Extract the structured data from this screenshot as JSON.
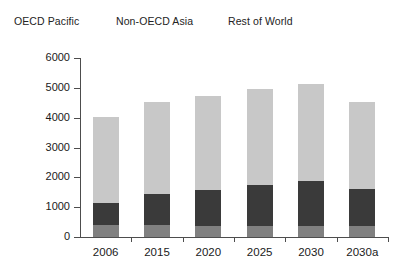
{
  "chart_data": {
    "type": "bar",
    "subtype": "stacked-vertical",
    "title": "",
    "xlabel": "",
    "ylabel": "Mtoe",
    "ylim": [
      0,
      6000
    ],
    "ytick_values": [
      0,
      1000,
      2000,
      3000,
      4000,
      5000,
      6000
    ],
    "ytick_labels": [
      "0",
      "1000",
      "2000",
      "3000",
      "4000",
      "5000",
      "6000"
    ],
    "grid": false,
    "legend_position": "top",
    "categories": [
      "2006",
      "2015",
      "2020",
      "2025",
      "2030",
      "2030a"
    ],
    "series": [
      {
        "name": "OECD Pacific",
        "color": "#808080",
        "values": [
          400,
          390,
          370,
          380,
          370,
          360
        ]
      },
      {
        "name": "Non-OECD Asia",
        "color": "#3a3a3a",
        "values": [
          750,
          1060,
          1210,
          1360,
          1520,
          1260
        ]
      },
      {
        "name": "Rest of World",
        "color": "#c8c8c8",
        "values": [
          2870,
          3060,
          3160,
          3210,
          3250,
          2900
        ]
      }
    ],
    "totals": [
      4020,
      4510,
      4740,
      4950,
      5140,
      4520
    ]
  },
  "legend": {
    "entries": [
      {
        "label": "OECD Pacific"
      },
      {
        "label": "Non-OECD Asia"
      },
      {
        "label": "Rest of World"
      }
    ]
  },
  "axes": {
    "y_title": "Mtoe"
  },
  "colors": {
    "axis": "#4d4d4d",
    "text": "#1a1a1a",
    "background": "#ffffff",
    "series_oecd_pacific": "#808080",
    "series_non_oecd_asia": "#3a3a3a",
    "series_rest_of_world": "#c8c8c8"
  }
}
